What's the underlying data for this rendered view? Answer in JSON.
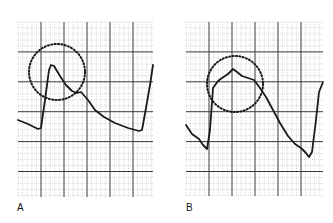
{
  "figure": {
    "panels": [
      {
        "label": "A",
        "grid": {
          "x": 18,
          "y": 22,
          "width": 135,
          "height": 175
        },
        "trace": [
          [
            18,
            120
          ],
          [
            28,
            124
          ],
          [
            38,
            129
          ],
          [
            41,
            128
          ],
          [
            45,
            100
          ],
          [
            49,
            70
          ],
          [
            51,
            65
          ],
          [
            54,
            66
          ],
          [
            60,
            76
          ],
          [
            66,
            85
          ],
          [
            72,
            91
          ],
          [
            77,
            93
          ],
          [
            81,
            92
          ],
          [
            88,
            100
          ],
          [
            95,
            110
          ],
          [
            104,
            117
          ],
          [
            115,
            123
          ],
          [
            128,
            128
          ],
          [
            139,
            131
          ],
          [
            142,
            130
          ],
          [
            146,
            108
          ],
          [
            150,
            85
          ],
          [
            153,
            65
          ]
        ],
        "circle": {
          "cx": 57,
          "cy": 72,
          "r": 28
        }
      },
      {
        "label": "B",
        "grid": {
          "x": 186,
          "y": 22,
          "width": 137,
          "height": 174
        },
        "trace": [
          [
            186,
            125
          ],
          [
            192,
            134
          ],
          [
            199,
            139
          ],
          [
            203,
            145
          ],
          [
            207,
            149
          ],
          [
            210,
            130
          ],
          [
            213,
            88
          ],
          [
            218,
            81
          ],
          [
            222,
            78
          ],
          [
            228,
            74
          ],
          [
            233,
            69
          ],
          [
            237,
            72
          ],
          [
            242,
            76
          ],
          [
            248,
            78
          ],
          [
            254,
            80
          ],
          [
            260,
            88
          ],
          [
            266,
            97
          ],
          [
            273,
            110
          ],
          [
            280,
            123
          ],
          [
            288,
            136
          ],
          [
            295,
            144
          ],
          [
            301,
            148
          ],
          [
            306,
            153
          ],
          [
            309,
            157
          ],
          [
            312,
            152
          ],
          [
            316,
            120
          ],
          [
            319,
            92
          ],
          [
            323,
            82
          ]
        ],
        "circle": {
          "cx": 235,
          "cy": 84,
          "r": 28
        }
      }
    ],
    "colors": {
      "trace": "#1a1a1a",
      "major_grid": "#3a3a3a",
      "minor_grid": "#b5b5b5",
      "circle": "#1a1a1a"
    }
  }
}
